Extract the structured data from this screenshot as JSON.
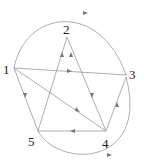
{
  "diagram": {
    "type": "directed-graph",
    "nodes": [
      {
        "id": "1",
        "label": "1",
        "x": 13,
        "y": 70
      },
      {
        "id": "2",
        "label": "2",
        "x": 67,
        "y": 37
      },
      {
        "id": "3",
        "label": "3",
        "x": 126,
        "y": 75
      },
      {
        "id": "4",
        "label": "4",
        "x": 106,
        "y": 132
      },
      {
        "id": "5",
        "label": "5",
        "x": 38,
        "y": 132
      }
    ],
    "edges": [
      {
        "from": "1",
        "to": "3",
        "style": "arc-top"
      },
      {
        "from": "1",
        "to": "3",
        "style": "straight"
      },
      {
        "from": "1",
        "to": "4",
        "style": "straight"
      },
      {
        "from": "5",
        "to": "1",
        "style": "straight"
      },
      {
        "from": "5",
        "to": "2",
        "style": "straight"
      },
      {
        "from": "2",
        "to": "4",
        "style": "straight"
      },
      {
        "from": "4",
        "to": "3",
        "style": "straight"
      },
      {
        "from": "4",
        "to": "5",
        "style": "straight"
      },
      {
        "from": "5",
        "to": "3",
        "style": "arc-bottom"
      }
    ],
    "colors": {
      "edge": "#888888",
      "arrow": "#777777",
      "label": "#222222"
    }
  }
}
